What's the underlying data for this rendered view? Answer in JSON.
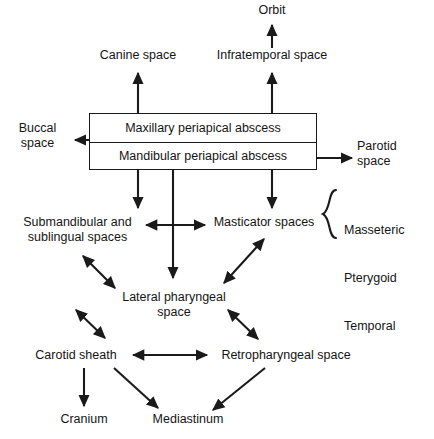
{
  "diagram": {
    "nodes": {
      "orbit": "Orbit",
      "canine_space": "Canine space",
      "infratemporal_space": "Infratemporal space",
      "buccal_space": "Buccal\nspace",
      "parotid_space": "Parotid\nspace",
      "maxillary_abscess": "Maxillary periapical abscess",
      "mandibular_abscess": "Mandibular periapical abscess",
      "submandibular_sublingual": "Submandibular and\nsublingual spaces",
      "masticator_spaces": "Masticator spaces",
      "lateral_pharyngeal": "Lateral pharyngeal\nspace",
      "carotid_sheath": "Carotid sheath",
      "retropharyngeal_space": "Retropharyngeal space",
      "cranium": "Cranium",
      "mediastinum": "Mediastinum"
    },
    "brace_group": {
      "items": [
        "Masseteric",
        "Pterygoid",
        "Temporal"
      ]
    },
    "colors": {
      "line": "#1a1a1a",
      "text": "#141414",
      "background": "#ffffff"
    }
  }
}
